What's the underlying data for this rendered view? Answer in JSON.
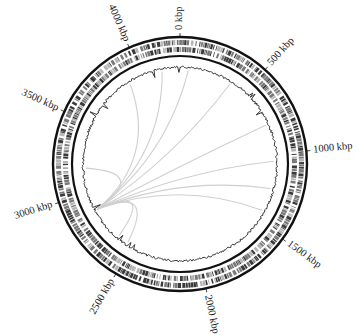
{
  "figure": {
    "type": "circular-genome-map",
    "total_length_kbp": 4280,
    "center": [
      180,
      164
    ],
    "colors": {
      "ring": "#111111",
      "feature_dark": "#3a3a3a",
      "feature_mid": "#7a7a7a",
      "feature_light": "#b5b5b5",
      "link_arcs": "#cfcfcf",
      "gc_trace": "#222222"
    },
    "tick_labels": [
      {
        "kbp": 0,
        "label": "0 kbp"
      },
      {
        "kbp": 500,
        "label": "500 kbp"
      },
      {
        "kbp": 1000,
        "label": "1000 kbp"
      },
      {
        "kbp": 1500,
        "label": "1500 kbp"
      },
      {
        "kbp": 2000,
        "label": "2000 kbp"
      },
      {
        "kbp": 2500,
        "label": "2500 kbp"
      },
      {
        "kbp": 3000,
        "label": "3000 kbp"
      },
      {
        "kbp": 3500,
        "label": "3500 kbp"
      },
      {
        "kbp": 4000,
        "label": "4000 kbp"
      }
    ],
    "tracks": [
      {
        "name": "outer-backbone-ring",
        "radius": 127
      },
      {
        "name": "forward-strand-features",
        "r_inner": 119,
        "r_outer": 124
      },
      {
        "name": "reverse-strand-features",
        "r_inner": 112,
        "r_outer": 117
      },
      {
        "name": "inner-backbone-ring",
        "radius": 108
      },
      {
        "name": "gc-content-trace",
        "radius": 97
      }
    ],
    "links": {
      "hub_kbp": 2870,
      "targets_kbp": [
        3900,
        4150,
        60,
        380,
        780,
        1050,
        1250,
        1420,
        3180,
        2620,
        2540
      ]
    }
  }
}
